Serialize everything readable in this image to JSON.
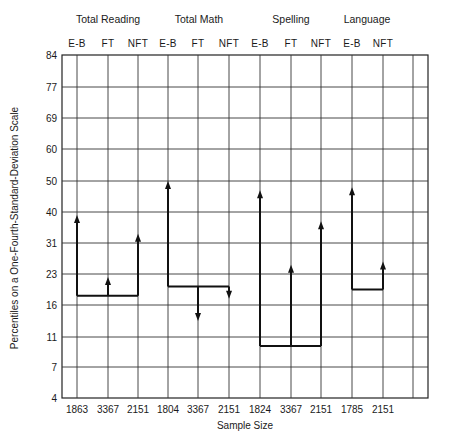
{
  "chart_data": {
    "type": "line",
    "title": "",
    "xlabel": "Sample Size",
    "ylabel": "Percentiles on a One-Fourth-Standard-Deviation Scale",
    "y_ticks": [
      84,
      77,
      69,
      60,
      50,
      40,
      31,
      23,
      16,
      11,
      7,
      4
    ],
    "ylim": [
      4,
      84
    ],
    "grid": true,
    "legend": null,
    "groups": [
      {
        "name": "Total Reading",
        "columns": [
          "E-B",
          "FT",
          "NFT"
        ]
      },
      {
        "name": "Total Math",
        "columns": [
          "E-B",
          "FT",
          "NFT"
        ]
      },
      {
        "name": "Spelling",
        "columns": [
          "E-B",
          "FT",
          "NFT"
        ]
      },
      {
        "name": "Language",
        "columns": [
          "E-B",
          "NFT"
        ]
      }
    ],
    "categories": [
      "E-B",
      "FT",
      "NFT",
      "E-B",
      "FT",
      "NFT",
      "E-B",
      "FT",
      "NFT",
      "E-B",
      "NFT"
    ],
    "sample_sizes": [
      "1863",
      "3367",
      "2151",
      "1804",
      "3367",
      "2151",
      "1824",
      "3367",
      "2151",
      "1785",
      "2151"
    ],
    "series": [
      {
        "name": "Total Reading",
        "baseline": 18,
        "values": {
          "E-B": 39,
          "FT": 22,
          "NFT": 34
        }
      },
      {
        "name": "Total Math",
        "baseline": 20,
        "values": {
          "E-B": 51,
          "FT": 13,
          "NFT": 17
        }
      },
      {
        "name": "Spelling",
        "baseline": 10,
        "values": {
          "E-B": 48,
          "FT": 26,
          "NFT": 37
        }
      },
      {
        "name": "Language",
        "baseline": 19,
        "values": {
          "E-B": 49,
          "NFT": 26
        }
      }
    ],
    "arrows_px": {
      "_note": "rendering geometry: scale positions where 0 = 4th percentile line and 11 = 84th percentile line",
      "groups": [
        {
          "base": 3.3,
          "cols": [
            0,
            1,
            2
          ],
          "tips": [
            5.9,
            3.9,
            5.3
          ]
        },
        {
          "base": 3.6,
          "cols": [
            3,
            4,
            5
          ],
          "tips": [
            7.0,
            2.5,
            3.2
          ]
        },
        {
          "base": 1.7,
          "cols": [
            6,
            7,
            8
          ],
          "tips": [
            6.7,
            4.3,
            5.7
          ]
        },
        {
          "base": 3.5,
          "cols": [
            9,
            10
          ],
          "tips": [
            6.8,
            4.4
          ]
        }
      ]
    }
  },
  "header": {
    "group_titles": [
      "Total Reading",
      "Total Math",
      "Spelling",
      "Language"
    ],
    "column_labels": [
      "E-B",
      "FT",
      "NFT",
      "E-B",
      "FT",
      "NFT",
      "E-B",
      "FT",
      "NFT",
      "E-B",
      "NFT"
    ]
  },
  "axes": {
    "y_ticks": [
      "84",
      "77",
      "69",
      "60",
      "50",
      "40",
      "31",
      "23",
      "16",
      "11",
      "7",
      "4"
    ],
    "x_ticks": [
      "1863",
      "3367",
      "2151",
      "1804",
      "3367",
      "2151",
      "1824",
      "3367",
      "2151",
      "1785",
      "2151"
    ],
    "x_title": "Sample Size",
    "y_title": "Percentiles on a One-Fourth-Standard-Deviation Scale"
  }
}
